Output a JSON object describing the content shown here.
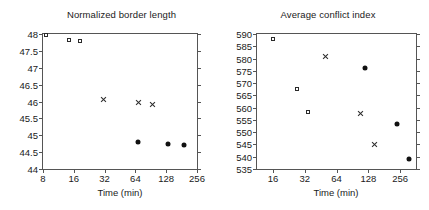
{
  "chart_data": [
    {
      "type": "scatter",
      "title": "Normalized border length",
      "xlabel": "Time (min)",
      "ylabel": "",
      "xscale": "log2",
      "xlim": [
        8,
        256
      ],
      "ylim": [
        44,
        48
      ],
      "grid": false,
      "legend": "none",
      "xticks": [
        "8",
        "16",
        "32",
        "64",
        "128",
        "256"
      ],
      "xtick_values": [
        8,
        16,
        32,
        64,
        128,
        256
      ],
      "yticks": [
        "44",
        "44.5",
        "45",
        "45.5",
        "46",
        "46.5",
        "47",
        "47.5",
        "48"
      ],
      "ytick_values": [
        44,
        44.5,
        45,
        45.5,
        46,
        46.5,
        47,
        47.5,
        48
      ],
      "series": [
        {
          "name": "open-square",
          "marker": "open-square",
          "points": [
            {
              "x": 8.5,
              "y": 47.97
            },
            {
              "x": 14.5,
              "y": 47.83
            },
            {
              "x": 18.6,
              "y": 47.78
            }
          ]
        },
        {
          "name": "cross",
          "marker": "cross",
          "points": [
            {
              "x": 31.0,
              "y": 46.05
            },
            {
              "x": 68.0,
              "y": 45.97
            },
            {
              "x": 95.0,
              "y": 45.92
            }
          ]
        },
        {
          "name": "filled-circle",
          "marker": "filled-circle",
          "points": [
            {
              "x": 68.0,
              "y": 44.8
            },
            {
              "x": 132.0,
              "y": 44.73
            },
            {
              "x": 190.0,
              "y": 44.7
            }
          ]
        }
      ]
    },
    {
      "type": "scatter",
      "title": "Average conflict index",
      "xlabel": "Time (min)",
      "ylabel": "",
      "xscale": "log2",
      "xlim": [
        11.3,
        362
      ],
      "ylim": [
        535,
        590
      ],
      "grid": false,
      "legend": "none",
      "xticks": [
        "16",
        "32",
        "64",
        "128",
        "256"
      ],
      "xtick_values": [
        16,
        32,
        64,
        128,
        256
      ],
      "yticks": [
        "535",
        "540",
        "545",
        "550",
        "555",
        "560",
        "565",
        "570",
        "575",
        "580",
        "585",
        "590"
      ],
      "ytick_values": [
        535,
        540,
        545,
        550,
        555,
        560,
        565,
        570,
        575,
        580,
        585,
        590
      ],
      "series": [
        {
          "name": "open-square",
          "marker": "open-square",
          "points": [
            {
              "x": 16.0,
              "y": 588.0
            },
            {
              "x": 27.0,
              "y": 567.5
            },
            {
              "x": 34.0,
              "y": 558.3
            }
          ]
        },
        {
          "name": "cross",
          "marker": "cross",
          "points": [
            {
              "x": 50.0,
              "y": 581.0
            },
            {
              "x": 108.0,
              "y": 557.5
            },
            {
              "x": 145.0,
              "y": 545.0
            }
          ]
        },
        {
          "name": "filled-circle",
          "marker": "filled-circle",
          "points": [
            {
              "x": 118.0,
              "y": 576.0
            },
            {
              "x": 240.0,
              "y": 553.5
            },
            {
              "x": 310.0,
              "y": 539.0
            }
          ]
        }
      ]
    }
  ]
}
